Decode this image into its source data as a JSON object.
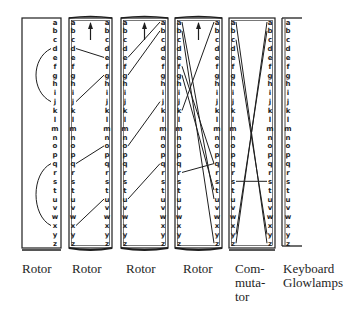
{
  "alphabet": [
    "a",
    "b",
    "c",
    "d",
    "e",
    "f",
    "g",
    "h",
    "i",
    "j",
    "k",
    "l",
    "m",
    "n",
    "o",
    "p",
    "q",
    "r",
    "s",
    "t",
    "u",
    "v",
    "w",
    "x",
    "y",
    "z"
  ],
  "colors": {
    "ink": "#1e1e1e",
    "background": "#ffffff"
  },
  "components": [
    {
      "id": "rotor-1",
      "label": "Rotor",
      "type": "reflector-rotor",
      "box": {
        "x": 22,
        "y": 18,
        "w": 39,
        "h": 230
      },
      "columns": [
        "right"
      ],
      "arrow": false,
      "arcs": [
        [
          "d",
          "j"
        ],
        [
          "q",
          "x"
        ]
      ],
      "wires": []
    },
    {
      "id": "rotor-2",
      "label": "Rotor",
      "type": "rotor",
      "box": {
        "x": 69,
        "y": 18,
        "w": 43,
        "h": 230
      },
      "columns": [
        "left",
        "right"
      ],
      "arrow": true,
      "arcs": [],
      "wires": [
        [
          "d",
          "e"
        ],
        [
          "j",
          "g"
        ],
        [
          "q",
          "o"
        ],
        [
          "x",
          "u"
        ]
      ]
    },
    {
      "id": "rotor-3",
      "label": "Rotor",
      "type": "rotor",
      "box": {
        "x": 121,
        "y": 18,
        "w": 47,
        "h": 230
      },
      "columns": [
        "left",
        "right"
      ],
      "arrow": true,
      "arcs": [],
      "wires": [
        [
          "e",
          "a"
        ],
        [
          "g",
          "b"
        ],
        [
          "o",
          "j"
        ],
        [
          "u",
          "q"
        ]
      ]
    },
    {
      "id": "rotor-4",
      "label": "Rotor",
      "type": "rotor",
      "box": {
        "x": 175,
        "y": 18,
        "w": 47,
        "h": 230
      },
      "columns": [
        "left",
        "right"
      ],
      "arrow": true,
      "arcs": [],
      "wires": [
        [
          "a",
          "u"
        ],
        [
          "b",
          "z"
        ],
        [
          "k",
          "a"
        ],
        [
          "f",
          "q"
        ],
        [
          "r",
          "q"
        ],
        [
          "g",
          "t"
        ]
      ]
    },
    {
      "id": "commutator",
      "label": "Com-\nmuta-\ntor",
      "label_lines": [
        "Com-",
        "muta-",
        "tor"
      ],
      "type": "commutator",
      "box": {
        "x": 229,
        "y": 18,
        "w": 46,
        "h": 230
      },
      "columns": [
        "left",
        "right"
      ],
      "arrow": false,
      "arcs": [],
      "wires": [
        [
          "a",
          "z"
        ],
        [
          "c",
          "y"
        ],
        [
          "z",
          "a"
        ],
        [
          "y",
          "b"
        ],
        [
          "s",
          "s"
        ]
      ]
    },
    {
      "id": "keyboard-glowlamps",
      "label": "Keyboard Glowlamps",
      "label_lines": [
        "Keyboard",
        "Glowlamps"
      ],
      "type": "keyboard",
      "box": {
        "x": 282,
        "y": 18,
        "w": 18,
        "h": 230
      },
      "columns": [
        "left"
      ],
      "arrow": false,
      "arcs": [],
      "wires": []
    }
  ],
  "labels": {
    "rotor1": "Rotor",
    "rotor2": "Rotor",
    "rotor3": "Rotor",
    "rotor4": "Rotor",
    "commutator_l1": "Com-",
    "commutator_l2": "muta-",
    "commutator_l3": "tor",
    "keyboard_l1": "Keyboard",
    "keyboard_l2": "Glowlamps"
  }
}
